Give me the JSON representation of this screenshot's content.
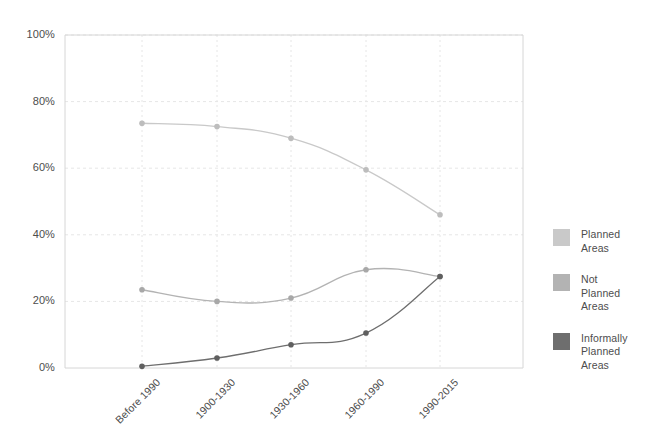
{
  "chart_data": {
    "type": "line",
    "title": "",
    "subtitle": "",
    "xlabel": "",
    "ylabel": "",
    "categories": [
      "Before 1990",
      "1900-1930",
      "1930-1960",
      "1960-1990",
      "1990-2015"
    ],
    "ylim": [
      0,
      100
    ],
    "yticks": [
      0,
      20,
      40,
      60,
      80,
      100
    ],
    "ytick_labels": [
      "0%",
      "20%",
      "40%",
      "60%",
      "80%",
      "100%"
    ],
    "grid": true,
    "legend_position": "right",
    "value_suffix": "%",
    "series": [
      {
        "name": "Planned Areas",
        "legend_label": "Planned\nAreas",
        "color": "#c9c9c9",
        "marker_color": "#bdbdbd",
        "values": [
          73.5,
          72.5,
          69,
          59.5,
          46
        ]
      },
      {
        "name": "Not Planned Areas",
        "legend_label": "Not\nPlanned\nAreas",
        "color": "#b3b3b3",
        "marker_color": "#a8a8a8",
        "values": [
          23.5,
          20,
          21,
          29.5,
          27.5
        ]
      },
      {
        "name": "Informally Planned Areas",
        "legend_label": "Informally\nPlanned\nAreas",
        "color": "#6e6e6e",
        "marker_color": "#5f5f5f",
        "values": [
          0.5,
          3,
          7,
          10.5,
          27.5
        ]
      }
    ]
  },
  "axes": {
    "axis_color": "#d6d6d6",
    "grid_color": "#e6e6e6",
    "background": "#ffffff"
  }
}
